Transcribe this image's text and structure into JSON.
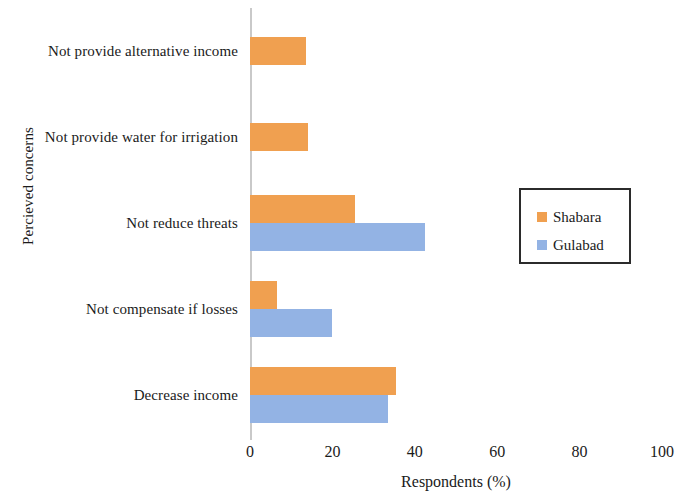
{
  "chart_data": {
    "type": "bar",
    "orientation": "horizontal",
    "title": "",
    "xlabel": "Respondents (%)",
    "ylabel": "Percieved concerns",
    "xlim": [
      0,
      100
    ],
    "xticks": [
      0,
      20,
      40,
      60,
      80,
      100
    ],
    "xtick_labels": [
      "0",
      "20",
      "40",
      "60",
      "80",
      "100"
    ],
    "grid": false,
    "legend_position": "right",
    "categories": [
      "Decrease income",
      "Not compensate if losses",
      "Not reduce threats",
      "Not provide water for irrigation",
      "Not provide alternative income"
    ],
    "series": [
      {
        "name": "Shabara",
        "color": "#F0A050",
        "values": [
          35.5,
          6.5,
          25.5,
          14,
          13.5
        ]
      },
      {
        "name": "Gulabad",
        "color": "#93B3E4",
        "values": [
          33.5,
          20,
          42.5,
          null,
          null
        ]
      }
    ]
  },
  "legend": {
    "entries": [
      {
        "label": "Shabara",
        "swatch": "shabara"
      },
      {
        "label": "Gulabad",
        "swatch": "gulabad"
      }
    ]
  }
}
